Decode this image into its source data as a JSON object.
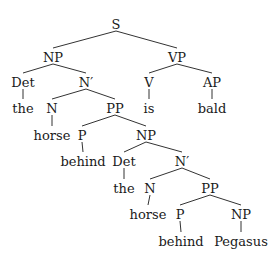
{
  "diagram": {
    "type": "syntax-tree",
    "nodes": [
      {
        "id": "S",
        "label": "S",
        "x": 116,
        "y": 24
      },
      {
        "id": "NP1",
        "label": "NP",
        "x": 53,
        "y": 57
      },
      {
        "id": "VP",
        "label": "VP",
        "x": 177,
        "y": 57
      },
      {
        "id": "Det1",
        "label": "Det",
        "x": 23,
        "y": 82
      },
      {
        "id": "Nbar1",
        "label": "N′",
        "x": 86,
        "y": 82
      },
      {
        "id": "V",
        "label": "V",
        "x": 149,
        "y": 82
      },
      {
        "id": "AP",
        "label": "AP",
        "x": 212,
        "y": 82
      },
      {
        "id": "the1",
        "label": "the",
        "x": 23,
        "y": 108
      },
      {
        "id": "N1",
        "label": "N",
        "x": 52,
        "y": 108
      },
      {
        "id": "PP1",
        "label": "PP",
        "x": 115,
        "y": 108
      },
      {
        "id": "is",
        "label": "is",
        "x": 149,
        "y": 108
      },
      {
        "id": "bald",
        "label": "bald",
        "x": 212,
        "y": 108
      },
      {
        "id": "horse1",
        "label": "horse",
        "x": 52,
        "y": 135
      },
      {
        "id": "P1",
        "label": "P",
        "x": 82,
        "y": 135
      },
      {
        "id": "NP2",
        "label": "NP",
        "x": 146,
        "y": 135
      },
      {
        "id": "behind1",
        "label": "behind",
        "x": 83,
        "y": 161
      },
      {
        "id": "Det2",
        "label": "Det",
        "x": 124,
        "y": 161
      },
      {
        "id": "Nbar2",
        "label": "N′",
        "x": 182,
        "y": 161
      },
      {
        "id": "the2",
        "label": "the",
        "x": 124,
        "y": 188
      },
      {
        "id": "N2",
        "label": "N",
        "x": 150,
        "y": 188
      },
      {
        "id": "PP2",
        "label": "PP",
        "x": 210,
        "y": 188
      },
      {
        "id": "horse2",
        "label": "horse",
        "x": 148,
        "y": 214
      },
      {
        "id": "P2",
        "label": "P",
        "x": 180,
        "y": 214
      },
      {
        "id": "NP3",
        "label": "NP",
        "x": 241,
        "y": 214
      },
      {
        "id": "behind2",
        "label": "behind",
        "x": 181,
        "y": 241
      },
      {
        "id": "Pegasus",
        "label": "Pegasus",
        "x": 241,
        "y": 241
      }
    ],
    "edges": [
      [
        "S",
        "NP1"
      ],
      [
        "S",
        "VP"
      ],
      [
        "NP1",
        "Det1"
      ],
      [
        "NP1",
        "Nbar1"
      ],
      [
        "VP",
        "V"
      ],
      [
        "VP",
        "AP"
      ],
      [
        "Det1",
        "the1"
      ],
      [
        "Nbar1",
        "N1"
      ],
      [
        "Nbar1",
        "PP1"
      ],
      [
        "V",
        "is"
      ],
      [
        "AP",
        "bald"
      ],
      [
        "N1",
        "horse1"
      ],
      [
        "PP1",
        "P1"
      ],
      [
        "PP1",
        "NP2"
      ],
      [
        "P1",
        "behind1"
      ],
      [
        "NP2",
        "Det2"
      ],
      [
        "NP2",
        "Nbar2"
      ],
      [
        "Det2",
        "the2"
      ],
      [
        "Nbar2",
        "N2"
      ],
      [
        "Nbar2",
        "PP2"
      ],
      [
        "N2",
        "horse2"
      ],
      [
        "PP2",
        "P2"
      ],
      [
        "PP2",
        "NP3"
      ],
      [
        "P2",
        "behind2"
      ],
      [
        "NP3",
        "Pegasus"
      ]
    ]
  }
}
